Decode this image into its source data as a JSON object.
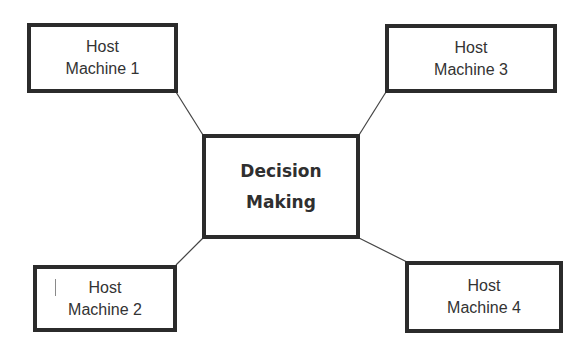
{
  "diagram": {
    "type": "hub-and-spoke",
    "center": {
      "lines": [
        "Decision",
        "Making"
      ]
    },
    "nodes": [
      {
        "id": "host1",
        "lines": [
          "Host",
          "Machine 1"
        ],
        "position": "top-left"
      },
      {
        "id": "host3",
        "lines": [
          "Host",
          "Machine 3"
        ],
        "position": "top-right"
      },
      {
        "id": "host2",
        "lines": [
          "Host",
          "Machine 2"
        ],
        "position": "bottom-left"
      },
      {
        "id": "host4",
        "lines": [
          "Host",
          "Machine 4"
        ],
        "position": "bottom-right"
      }
    ],
    "edges": [
      {
        "from": "host1",
        "to": "center"
      },
      {
        "from": "host3",
        "to": "center"
      },
      {
        "from": "host2",
        "to": "center"
      },
      {
        "from": "host4",
        "to": "center"
      }
    ],
    "colors": {
      "border": "#2b2b2b",
      "text": "#333333",
      "connector": "#444444",
      "background": "#ffffff"
    }
  }
}
